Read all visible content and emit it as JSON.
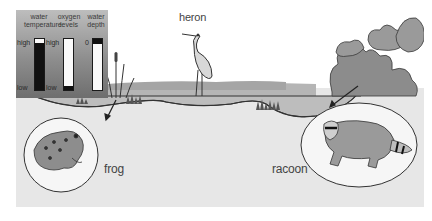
{
  "gauges": {
    "panel_title": "",
    "items": [
      {
        "title_line1": "water",
        "title_line2": "temperature",
        "top_label": "high",
        "bottom_label": "low",
        "level": "high"
      },
      {
        "title_line1": "oxygen",
        "title_line2": "levels",
        "top_label": "high",
        "bottom_label": "low",
        "level": "low"
      },
      {
        "title_line1": "water",
        "title_line2": "depth",
        "top_label": "0",
        "bottom_label": "",
        "level": "shallow-full"
      }
    ]
  },
  "labels": {
    "heron": "heron",
    "frog": "frog",
    "racoon": "racoon"
  },
  "colors": {
    "ground": "#e6e6e6",
    "ink": "#2b2b2b",
    "foliage": "#8a8a8a",
    "panel_top": "#bdbdbd",
    "panel_bottom": "#6e6e6e"
  }
}
